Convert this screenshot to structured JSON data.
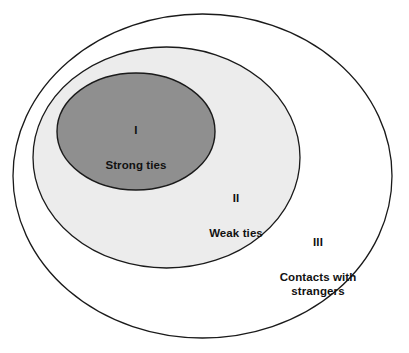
{
  "diagram": {
    "type": "nested-venn-ellipses",
    "background_color": "#ffffff",
    "stroke_color": "#1a1a1a",
    "regions": [
      {
        "id": "region-1",
        "roman": "I",
        "label": "Strong ties",
        "fill_color": "#8f8f8f",
        "level": 1
      },
      {
        "id": "region-2",
        "roman": "II",
        "label": "Weak ties",
        "fill_color": "#ececec",
        "level": 2
      },
      {
        "id": "region-3",
        "roman": "III",
        "label": "Contacts with\nstrangers",
        "fill_color": "#ffffff",
        "level": 3
      }
    ]
  }
}
